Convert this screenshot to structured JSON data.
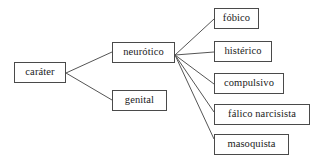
{
  "diagram": {
    "type": "tree",
    "title": "caráter",
    "orientation": "left-to-right",
    "style": {
      "background_color": "#ffffff",
      "box_border_color": "#4a4a4a",
      "edge_color": "#555555",
      "text_color": "#1a1a1a"
    },
    "nodes": [
      {
        "id": "carater",
        "label": "caráter",
        "level": 0,
        "x": 14,
        "y": 62,
        "w": 52,
        "h": 21
      },
      {
        "id": "neurotico",
        "label": "neurótico",
        "level": 1,
        "x": 112,
        "y": 42,
        "w": 63,
        "h": 21
      },
      {
        "id": "genital",
        "label": "genital",
        "level": 1,
        "x": 112,
        "y": 90,
        "w": 55,
        "h": 21
      },
      {
        "id": "fobico",
        "label": "fóbico",
        "level": 2,
        "x": 214,
        "y": 8,
        "w": 45,
        "h": 21
      },
      {
        "id": "histerico",
        "label": "histérico",
        "level": 2,
        "x": 214,
        "y": 41,
        "w": 58,
        "h": 21
      },
      {
        "id": "compulsivo",
        "label": "compulsivo",
        "level": 2,
        "x": 214,
        "y": 73,
        "w": 70,
        "h": 21
      },
      {
        "id": "falico",
        "label": "fálico narcisista",
        "level": 2,
        "x": 214,
        "y": 104,
        "w": 96,
        "h": 21
      },
      {
        "id": "masoquista",
        "label": "masoquista",
        "level": 2,
        "x": 214,
        "y": 134,
        "w": 75,
        "h": 21
      }
    ],
    "edges": [
      {
        "from": "carater",
        "to": "neurotico",
        "x1": 66,
        "y1": 73,
        "x2": 112,
        "y2": 52
      },
      {
        "from": "carater",
        "to": "genital",
        "x1": 66,
        "y1": 73,
        "x2": 112,
        "y2": 100
      },
      {
        "from": "neurotico",
        "to": "fobico",
        "x1": 175,
        "y1": 55,
        "x2": 214,
        "y2": 19
      },
      {
        "from": "neurotico",
        "to": "histerico",
        "x1": 175,
        "y1": 55,
        "x2": 214,
        "y2": 52
      },
      {
        "from": "neurotico",
        "to": "compulsivo",
        "x1": 175,
        "y1": 55,
        "x2": 214,
        "y2": 84
      },
      {
        "from": "neurotico",
        "to": "falico",
        "x1": 175,
        "y1": 55,
        "x2": 214,
        "y2": 112
      },
      {
        "from": "neurotico",
        "to": "masoquista",
        "x1": 175,
        "y1": 55,
        "x2": 214,
        "y2": 139
      }
    ]
  }
}
